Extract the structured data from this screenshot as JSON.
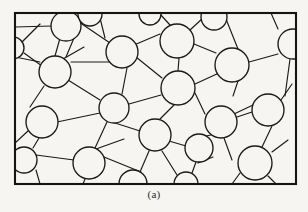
{
  "figure": {
    "caption": "(a)",
    "kind": "polycrystalline-microstructure-schematic",
    "canvas": {
      "width": 308,
      "height": 212
    },
    "colors": {
      "background": "#f7f5f1",
      "line": "#1a1a1a",
      "circle_fill": "#f7f5f1",
      "frame": "#141414",
      "caption_text": "#2b2b2b"
    },
    "frame": {
      "x": 15,
      "y": 13,
      "width": 281,
      "height": 171,
      "stroke_width": 2.1
    },
    "style": {
      "boundary_stroke_width": 1.15,
      "circle_stroke_width": 1.35
    },
    "counts": {
      "circles": 22,
      "boundary_segments": 50
    },
    "circles": [
      {
        "id": "c1",
        "cx": 13,
        "cy": 48,
        "r": 11,
        "clipped": "left"
      },
      {
        "id": "c2",
        "cx": 66,
        "cy": 26,
        "r": 15,
        "clipped": "none"
      },
      {
        "id": "c3",
        "cx": 122,
        "cy": 52,
        "r": 16,
        "clipped": "none"
      },
      {
        "id": "c4",
        "cx": 177,
        "cy": 41,
        "r": 17,
        "clipped": "none"
      },
      {
        "id": "c5",
        "cx": 214,
        "cy": 17,
        "r": 13,
        "clipped": "top"
      },
      {
        "id": "c6",
        "cx": 293,
        "cy": 44,
        "r": 15,
        "clipped": "right"
      },
      {
        "id": "c7",
        "cx": 232,
        "cy": 65,
        "r": 17,
        "clipped": "none"
      },
      {
        "id": "c8",
        "cx": 55,
        "cy": 72,
        "r": 16,
        "clipped": "none"
      },
      {
        "id": "c9",
        "cx": 178,
        "cy": 88,
        "r": 17,
        "clipped": "none"
      },
      {
        "id": "c10",
        "cx": 114,
        "cy": 108,
        "r": 15,
        "clipped": "none"
      },
      {
        "id": "c11",
        "cx": 268,
        "cy": 110,
        "r": 16,
        "clipped": "none"
      },
      {
        "id": "c12",
        "cx": 42,
        "cy": 122,
        "r": 16,
        "clipped": "none"
      },
      {
        "id": "c13",
        "cx": 221,
        "cy": 122,
        "r": 16,
        "clipped": "none"
      },
      {
        "id": "c14",
        "cx": 155,
        "cy": 135,
        "r": 16,
        "clipped": "none"
      },
      {
        "id": "c15",
        "cx": 89,
        "cy": 163,
        "r": 16,
        "clipped": "none"
      },
      {
        "id": "c16",
        "cx": 255,
        "cy": 163,
        "r": 17,
        "clipped": "none"
      },
      {
        "id": "c17",
        "cx": 24,
        "cy": 160,
        "r": 13,
        "clipped": "left"
      },
      {
        "id": "c18",
        "cx": 199,
        "cy": 148,
        "r": 14,
        "clipped": "none"
      },
      {
        "id": "c19",
        "cx": 133,
        "cy": 184,
        "r": 14,
        "clipped": "bottom"
      },
      {
        "id": "c20",
        "cx": 186,
        "cy": 184,
        "r": 12,
        "clipped": "bottom"
      },
      {
        "id": "c21",
        "cx": 90,
        "cy": 14,
        "r": 12,
        "clipped": "top"
      },
      {
        "id": "c22",
        "cx": 150,
        "cy": 14,
        "r": 11,
        "clipped": "top"
      }
    ],
    "boundaries": [
      {
        "x1": 15,
        "y1": 37,
        "x2": 4,
        "y2": 44
      },
      {
        "x1": 24,
        "y1": 53,
        "x2": 42,
        "y2": 66
      },
      {
        "x1": 22,
        "y1": 42,
        "x2": 40,
        "y2": 24
      },
      {
        "x1": 52,
        "y1": 26,
        "x2": 15,
        "y2": 27
      },
      {
        "x1": 66,
        "y1": 11,
        "x2": 63,
        "y2": 13
      },
      {
        "x1": 79,
        "y1": 22,
        "x2": 110,
        "y2": 43
      },
      {
        "x1": 74,
        "y1": 38,
        "x2": 66,
        "y2": 57
      },
      {
        "x1": 55,
        "y1": 56,
        "x2": 62,
        "y2": 31
      },
      {
        "x1": 40,
        "y1": 62,
        "x2": 15,
        "y2": 57
      },
      {
        "x1": 44,
        "y1": 86,
        "x2": 30,
        "y2": 107
      },
      {
        "x1": 68,
        "y1": 80,
        "x2": 100,
        "y2": 100
      },
      {
        "x1": 63,
        "y1": 59,
        "x2": 84,
        "y2": 47
      },
      {
        "x1": 99,
        "y1": 14,
        "x2": 105,
        "y2": 38
      },
      {
        "x1": 110,
        "y1": 62,
        "x2": 71,
        "y2": 62
      },
      {
        "x1": 134,
        "y1": 45,
        "x2": 160,
        "y2": 34
      },
      {
        "x1": 127,
        "y1": 68,
        "x2": 122,
        "y2": 94
      },
      {
        "x1": 136,
        "y1": 57,
        "x2": 162,
        "y2": 78
      },
      {
        "x1": 160,
        "y1": 14,
        "x2": 170,
        "y2": 25
      },
      {
        "x1": 190,
        "y1": 30,
        "x2": 203,
        "y2": 18
      },
      {
        "x1": 194,
        "y1": 44,
        "x2": 216,
        "y2": 53
      },
      {
        "x1": 179,
        "y1": 58,
        "x2": 178,
        "y2": 71
      },
      {
        "x1": 224,
        "y1": 14,
        "x2": 238,
        "y2": 49
      },
      {
        "x1": 226,
        "y1": 13,
        "x2": 212,
        "y2": 13
      },
      {
        "x1": 249,
        "y1": 62,
        "x2": 278,
        "y2": 54
      },
      {
        "x1": 238,
        "y1": 81,
        "x2": 233,
        "y2": 96
      },
      {
        "x1": 219,
        "y1": 73,
        "x2": 195,
        "y2": 84
      },
      {
        "x1": 278,
        "y1": 29,
        "x2": 271,
        "y2": 13
      },
      {
        "x1": 290,
        "y1": 59,
        "x2": 285,
        "y2": 96
      },
      {
        "x1": 195,
        "y1": 93,
        "x2": 205,
        "y2": 114
      },
      {
        "x1": 161,
        "y1": 95,
        "x2": 129,
        "y2": 104
      },
      {
        "x1": 174,
        "y1": 105,
        "x2": 160,
        "y2": 119
      },
      {
        "x1": 107,
        "y1": 122,
        "x2": 95,
        "y2": 148
      },
      {
        "x1": 100,
        "y1": 113,
        "x2": 57,
        "y2": 122
      },
      {
        "x1": 115,
        "y1": 123,
        "x2": 140,
        "y2": 131
      },
      {
        "x1": 39,
        "y1": 138,
        "x2": 33,
        "y2": 148
      },
      {
        "x1": 28,
        "y1": 131,
        "x2": 15,
        "y2": 143
      },
      {
        "x1": 252,
        "y1": 112,
        "x2": 237,
        "y2": 117
      },
      {
        "x1": 272,
        "y1": 126,
        "x2": 262,
        "y2": 147
      },
      {
        "x1": 281,
        "y1": 100,
        "x2": 292,
        "y2": 84
      },
      {
        "x1": 211,
        "y1": 135,
        "x2": 206,
        "y2": 136
      },
      {
        "x1": 234,
        "y1": 114,
        "x2": 253,
        "y2": 105
      },
      {
        "x1": 224,
        "y1": 138,
        "x2": 232,
        "y2": 160
      },
      {
        "x1": 169,
        "y1": 141,
        "x2": 186,
        "y2": 146
      },
      {
        "x1": 149,
        "y1": 151,
        "x2": 140,
        "y2": 172
      },
      {
        "x1": 162,
        "y1": 151,
        "x2": 177,
        "y2": 175
      },
      {
        "x1": 196,
        "y1": 162,
        "x2": 192,
        "y2": 173
      },
      {
        "x1": 104,
        "y1": 157,
        "x2": 141,
        "y2": 172
      },
      {
        "x1": 85,
        "y1": 179,
        "x2": 83,
        "y2": 184
      },
      {
        "x1": 74,
        "y1": 160,
        "x2": 36,
        "y2": 155
      },
      {
        "x1": 268,
        "y1": 176,
        "x2": 276,
        "y2": 184
      },
      {
        "x1": 240,
        "y1": 173,
        "x2": 232,
        "y2": 184
      },
      {
        "x1": 272,
        "y1": 152,
        "x2": 288,
        "y2": 140
      },
      {
        "x1": 96,
        "y1": 149,
        "x2": 124,
        "y2": 139
      },
      {
        "x1": 15,
        "y1": 169,
        "x2": 14,
        "y2": 170
      },
      {
        "x1": 36,
        "y1": 170,
        "x2": 40,
        "y2": 184
      },
      {
        "x1": 213,
        "y1": 157,
        "x2": 198,
        "y2": 163
      }
    ]
  }
}
